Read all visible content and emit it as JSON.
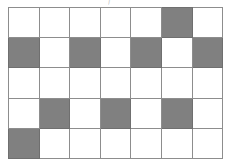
{
  "figure": {
    "kind": "checkerboard-grid",
    "columns": 7,
    "rows": 5,
    "colors": {
      "shaded": "#808080",
      "empty": "#ffffff",
      "gridline": "#8d8d8d",
      "background": "#ffffff"
    },
    "top_mark": "j",
    "cells": [
      [
        "empty",
        "empty",
        "empty",
        "empty",
        "empty",
        "shaded",
        "empty"
      ],
      [
        "shaded",
        "empty",
        "shaded",
        "empty",
        "shaded",
        "empty",
        "shaded"
      ],
      [
        "empty",
        "empty",
        "empty",
        "empty",
        "empty",
        "empty",
        "empty"
      ],
      [
        "empty",
        "shaded",
        "empty",
        "shaded",
        "empty",
        "shaded",
        "empty"
      ],
      [
        "shaded",
        "empty",
        "empty",
        "empty",
        "empty",
        "empty",
        "empty"
      ]
    ],
    "shaded_count": 9,
    "total_cells": 35
  }
}
